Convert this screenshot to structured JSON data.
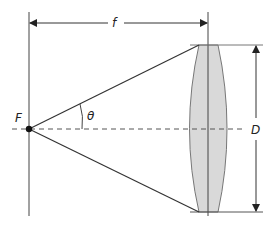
{
  "diagram": {
    "labels": {
      "focal_length": "f",
      "focal_point": "F",
      "angle": "θ",
      "diameter": "D"
    },
    "colors": {
      "line": "#333333",
      "lens_fill": "#d9d9d9",
      "lens_stroke": "#777777",
      "dashed_axis": "#555555"
    }
  }
}
